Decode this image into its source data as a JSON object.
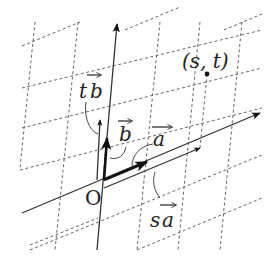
{
  "diagram": {
    "width": 279,
    "height": 269,
    "origin": {
      "x": 102,
      "y": 180,
      "label": "O"
    },
    "colors": {
      "line": "#333333",
      "grid": "#555555",
      "text": "#222222",
      "background": "#ffffff"
    },
    "grid_b_lines": [
      {
        "x1": 35,
        "y1": 22,
        "x2": 20,
        "y2": 168
      },
      {
        "x1": 78,
        "y1": 22,
        "x2": 55,
        "y2": 250
      },
      {
        "x1": 160,
        "y1": 22,
        "x2": 137,
        "y2": 250
      },
      {
        "x1": 200,
        "y1": 22,
        "x2": 178,
        "y2": 250
      },
      {
        "x1": 242,
        "y1": 22,
        "x2": 220,
        "y2": 250
      }
    ],
    "grid_a_lines": [
      {
        "x1": 22,
        "y1": 46,
        "x2": 80,
        "y2": 22
      },
      {
        "x1": 125,
        "y1": 30,
        "x2": 180,
        "y2": 7
      },
      {
        "x1": 224,
        "y1": 30,
        "x2": 262,
        "y2": 14
      },
      {
        "x1": 22,
        "y1": 88,
        "x2": 262,
        "y2": 30
      },
      {
        "x1": 22,
        "y1": 128,
        "x2": 262,
        "y2": 68
      },
      {
        "x1": 20,
        "y1": 170,
        "x2": 262,
        "y2": 108
      },
      {
        "x1": 30,
        "y1": 250,
        "x2": 262,
        "y2": 155
      },
      {
        "x1": 137,
        "y1": 250,
        "x2": 262,
        "y2": 198
      },
      {
        "x1": 30,
        "y1": 245,
        "x2": 98,
        "y2": 218
      }
    ],
    "axes": {
      "b_axis": {
        "x1": 97,
        "y1": 250,
        "x2": 117,
        "y2": 24
      },
      "a_axis": {
        "x1": 22,
        "y1": 213,
        "x2": 260,
        "y2": 113
      }
    },
    "vectors": {
      "b": {
        "x1": 104,
        "y1": 180,
        "x2": 107,
        "y2": 138,
        "label": "b"
      },
      "a": {
        "x1": 104,
        "y1": 180,
        "x2": 147,
        "y2": 162,
        "label": "a"
      },
      "tb": {
        "x1": 97,
        "y1": 180,
        "x2": 100,
        "y2": 120,
        "label": "tb"
      },
      "sa": {
        "x1": 104,
        "y1": 188,
        "x2": 200,
        "y2": 148,
        "label": "sa"
      }
    },
    "point": {
      "x": 207,
      "y": 74,
      "label": "(s, t)"
    },
    "labels": {
      "tb_t": "t",
      "tb_b": "b",
      "b": "b",
      "a": "a",
      "sa_s": "s",
      "sa_a": "a",
      "origin": "O",
      "point": "(s, t)"
    }
  }
}
